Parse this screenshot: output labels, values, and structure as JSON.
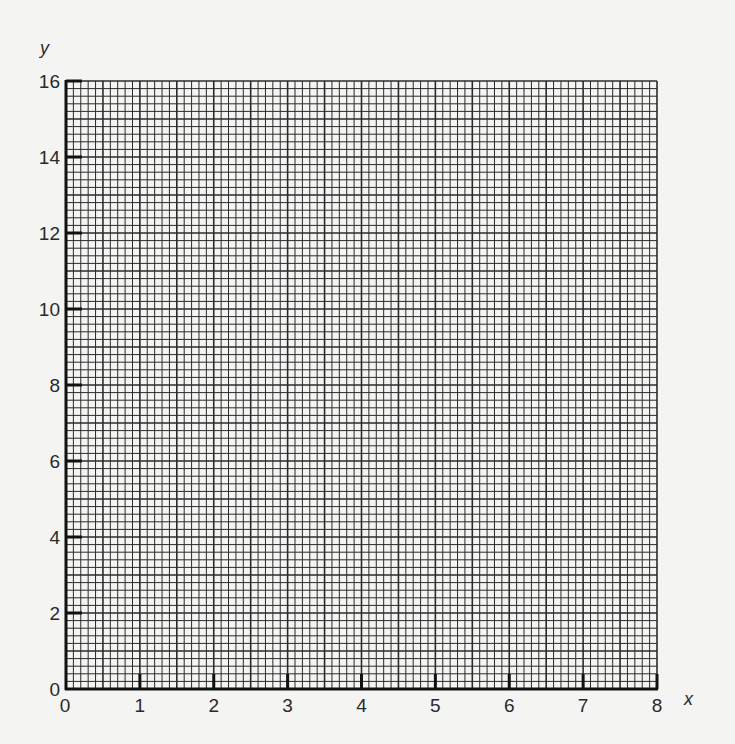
{
  "chart_data": {
    "type": "line",
    "title": "",
    "xlabel": "x",
    "ylabel": "y",
    "xlim": [
      0,
      8
    ],
    "ylim": [
      0,
      16
    ],
    "x_ticks": [
      0,
      1,
      2,
      3,
      4,
      5,
      6,
      7,
      8
    ],
    "y_ticks": [
      0,
      2,
      4,
      6,
      8,
      10,
      12,
      14,
      16
    ],
    "x_tick_labels": [
      "0",
      "1",
      "2",
      "3",
      "4",
      "5",
      "6",
      "7",
      "8"
    ],
    "y_tick_labels": [
      "0",
      "2",
      "4",
      "6",
      "8",
      "10",
      "12",
      "14",
      "16"
    ],
    "grid": true,
    "grid_minor_divisions_per_major_x": 10,
    "grid_minor_divisions_per_major_y": 10,
    "grid_emphasis_every": 5,
    "series": [],
    "legend": null,
    "colors": {
      "grid": "#2b2b2b",
      "background": "#f4f4f2",
      "axis": "#111111"
    }
  }
}
